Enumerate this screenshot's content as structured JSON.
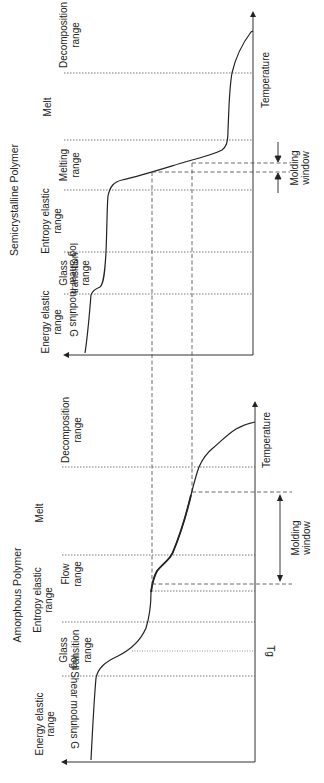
{
  "panels": {
    "semicrystalline": {
      "title": "Semicrystalline Polymer",
      "y_axis_label": "log Shear modulus G",
      "x_axis_label": "Temperature",
      "regions": [
        {
          "line1": "Energy elastic",
          "line2": "range"
        },
        {
          "line1": "Glass",
          "line2": "transition",
          "line3": "range"
        },
        {
          "line1": "Entropy elastic",
          "line2": "range"
        },
        {
          "line1": "Melting",
          "line2": "range"
        },
        {
          "line1": "Melt"
        },
        {
          "line1": "Decomposition",
          "line2": "range"
        }
      ],
      "molding_window": {
        "line1": "Molding",
        "line2": "window"
      }
    },
    "amorphous": {
      "title": "Amorphous Polymer",
      "y_axis_label": "log Shear modulus G",
      "x_axis_label": "Temperature",
      "tg_label": "Tg",
      "regions": [
        {
          "line1": "Energy elastic",
          "line2": "range"
        },
        {
          "line1": "Glass",
          "line2": "transition",
          "line3": "range"
        },
        {
          "line1": "Entropy elastic",
          "line2": "range"
        },
        {
          "line1": "Flow",
          "line2": "range"
        },
        {
          "line1": "Melt"
        },
        {
          "line1": "Decomposition",
          "line2": "range"
        }
      ],
      "molding_window": {
        "line1": "Molding",
        "line2": "window"
      }
    }
  },
  "colors": {
    "line": "#333333",
    "curve": "#222222",
    "dotted": "#555555",
    "text": "#222222"
  }
}
